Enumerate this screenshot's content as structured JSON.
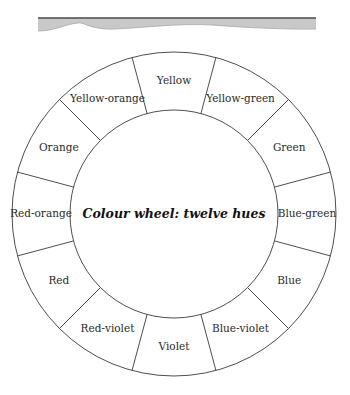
{
  "banner": {
    "x1": 38,
    "x2": 316,
    "top": 18,
    "fill": "#c9c9c9",
    "line_color": "#4a4a4a"
  },
  "wheel": {
    "cx": 174,
    "cy": 214,
    "outer_radius": 162,
    "inner_radius": 104,
    "label_radius": 133,
    "title": "Colour wheel: twelve hues",
    "hues": [
      {
        "name": "Yellow",
        "angle": -90
      },
      {
        "name": "Yellow-green",
        "angle": -60
      },
      {
        "name": "Green",
        "angle": -30
      },
      {
        "name": "Blue-green",
        "angle": 0
      },
      {
        "name": "Blue",
        "angle": 30
      },
      {
        "name": "Blue-violet",
        "angle": 60
      },
      {
        "name": "Violet",
        "angle": 90
      },
      {
        "name": "Red-violet",
        "angle": 120
      },
      {
        "name": "Red",
        "angle": 150
      },
      {
        "name": "Red-orange",
        "angle": 180
      },
      {
        "name": "Orange",
        "angle": 210
      },
      {
        "name": "Yellow-orange",
        "angle": 240
      }
    ]
  }
}
